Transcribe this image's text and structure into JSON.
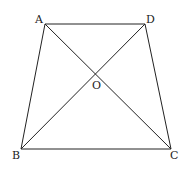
{
  "diagram": {
    "type": "trapezoid-with-diagonals",
    "stroke_color": "#222222",
    "background": "#ffffff",
    "points": {
      "A": {
        "x": 45,
        "y": 24
      },
      "D": {
        "x": 145,
        "y": 24
      },
      "B": {
        "x": 21,
        "y": 149
      },
      "C": {
        "x": 171,
        "y": 149
      },
      "O": {
        "x": 96,
        "y": 74
      }
    },
    "edges": [
      {
        "from": "A",
        "to": "D"
      },
      {
        "from": "D",
        "to": "C"
      },
      {
        "from": "C",
        "to": "B"
      },
      {
        "from": "B",
        "to": "A"
      },
      {
        "from": "A",
        "to": "C"
      },
      {
        "from": "B",
        "to": "D"
      }
    ],
    "labels": {
      "A": {
        "text": "A",
        "x": 35,
        "y": 23
      },
      "D": {
        "text": "D",
        "x": 146,
        "y": 23
      },
      "B": {
        "text": "B",
        "x": 12,
        "y": 159
      },
      "C": {
        "text": "C",
        "x": 170,
        "y": 159
      },
      "O": {
        "text": "O",
        "x": 92,
        "y": 89
      }
    }
  }
}
